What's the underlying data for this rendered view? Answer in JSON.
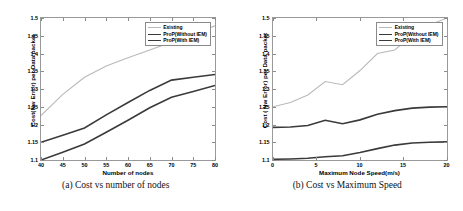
{
  "figure": {
    "panels": [
      {
        "caption": "(a) Cost vs number of nodes",
        "chart_data": {
          "type": "line",
          "title": "",
          "xlabel": "Number of nodes",
          "ylabel": "Cost(Nw Error) per Data packet",
          "xlim": [
            40,
            80
          ],
          "ylim": [
            1.1,
            1.5
          ],
          "xticks": [
            "40",
            "45",
            "50",
            "55",
            "60",
            "65",
            "70",
            "75",
            "80"
          ],
          "yticks": [
            "1.1",
            "1.15",
            "1.2",
            "1.25",
            "1.3",
            "1.35",
            "1.4",
            "1.45",
            "1.5"
          ],
          "grid": false,
          "legend_position": "upper right",
          "x": [
            40,
            45,
            50,
            55,
            60,
            65,
            70,
            75,
            80
          ],
          "series": [
            {
              "name": "Existing",
              "color": "#b9b9b9",
              "width": 1.1,
              "values": [
                1.225,
                1.285,
                1.333,
                1.365,
                1.388,
                1.41,
                1.432,
                1.455,
                1.478
              ]
            },
            {
              "name": "ProP(Without IEM)",
              "color": "#3a3a3a",
              "width": 1.6,
              "values": [
                1.15,
                1.17,
                1.19,
                1.227,
                1.262,
                1.296,
                1.325,
                1.333,
                1.341
              ]
            },
            {
              "name": "ProP(With IEM)",
              "color": "#3a3a3a",
              "width": 1.6,
              "values": [
                1.1,
                1.122,
                1.145,
                1.178,
                1.212,
                1.247,
                1.277,
                1.293,
                1.31
              ]
            }
          ]
        }
      },
      {
        "caption": "(b) Cost vs Maximum Speed",
        "chart_data": {
          "type": "line",
          "title": "",
          "xlabel": "Maximum Node Speed(m/s)",
          "ylabel": "Cost ( Nw Error) per Data packet",
          "xlim": [
            0,
            20
          ],
          "ylim": [
            1.1,
            1.5
          ],
          "xticks": [
            "0",
            "5",
            "10",
            "15",
            "20"
          ],
          "yticks": [
            "1.1",
            "1.15",
            "1.2",
            "1.25",
            "1.3",
            "1.35",
            "1.4",
            "1.45",
            "1.5"
          ],
          "grid": false,
          "legend_position": "upper right",
          "x": [
            0,
            2,
            4,
            6,
            8,
            10,
            12,
            14,
            16,
            18,
            20
          ],
          "series": [
            {
              "name": "Existing",
              "color": "#b9b9b9",
              "width": 1.1,
              "values": [
                1.25,
                1.262,
                1.283,
                1.321,
                1.312,
                1.352,
                1.4,
                1.41,
                1.452,
                1.48,
                1.5
              ]
            },
            {
              "name": "ProP(Without IEM)",
              "color": "#3a3a3a",
              "width": 1.6,
              "values": [
                1.192,
                1.193,
                1.197,
                1.212,
                1.202,
                1.213,
                1.229,
                1.239,
                1.246,
                1.249,
                1.25
              ]
            },
            {
              "name": "ProP(With IEM)",
              "color": "#3a3a3a",
              "width": 1.6,
              "values": [
                1.102,
                1.103,
                1.105,
                1.109,
                1.112,
                1.121,
                1.132,
                1.142,
                1.148,
                1.15,
                1.151
              ]
            }
          ]
        }
      }
    ]
  }
}
